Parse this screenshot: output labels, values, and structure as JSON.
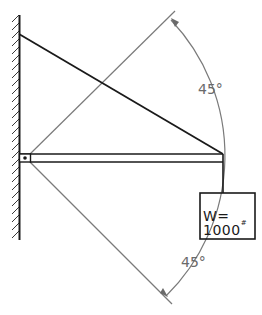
{
  "diagram": {
    "type": "structural-free-body",
    "elements": {
      "wall": {
        "label": "hatched wall support"
      },
      "beam": {
        "label": "horizontal beam",
        "support": "pin"
      },
      "cable": {
        "label": "tension cable from wall to beam end"
      },
      "load": {
        "label": "W= 1000",
        "unit_mark": "#",
        "text": "W= 1000#"
      },
      "angle_upper": {
        "label": "45°",
        "value": 45
      },
      "angle_lower": {
        "label": "45°",
        "value": 45
      }
    },
    "colors": {
      "ink": "#1a1a1a",
      "construction": "#7a7a7a"
    }
  }
}
